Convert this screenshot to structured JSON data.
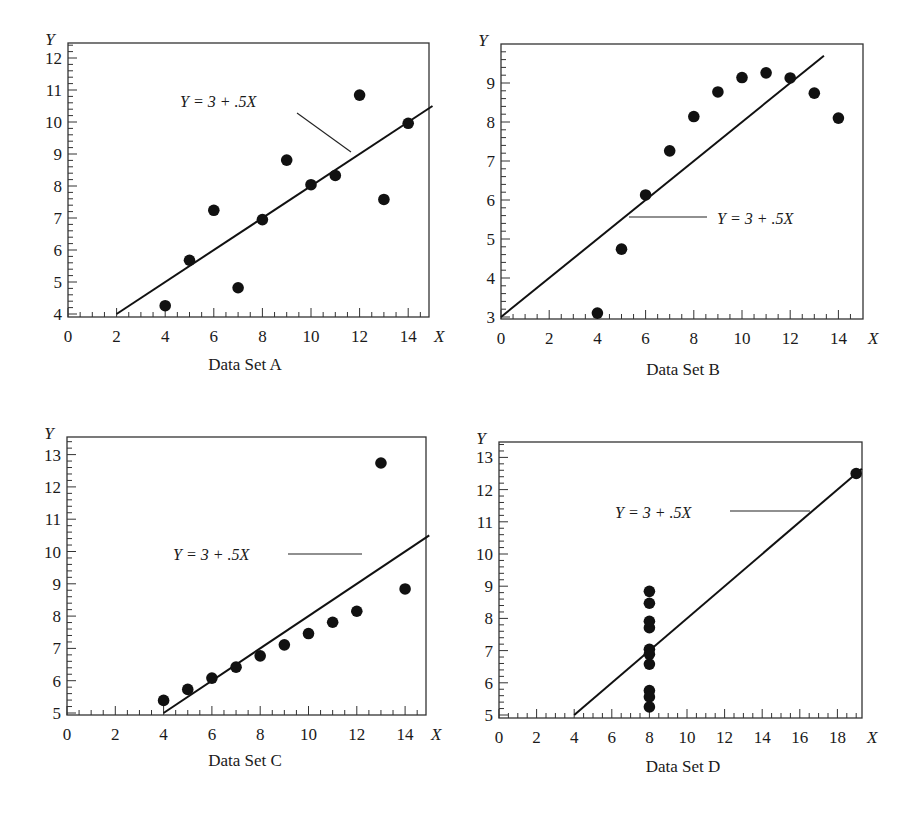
{
  "figure": {
    "equation_label": "Y = 3 + .5X",
    "x_axis_var": "X",
    "y_axis_var": "Y"
  },
  "chart_data": [
    {
      "type": "scatter",
      "title": "Data Set A",
      "xlabel": "X",
      "ylabel": "Y",
      "xlim": [
        0,
        15
      ],
      "ylim": [
        4,
        12.5
      ],
      "x_ticks": [
        0,
        2,
        4,
        6,
        8,
        10,
        12,
        14
      ],
      "y_ticks": [
        4,
        5,
        6,
        7,
        8,
        9,
        10,
        11,
        12
      ],
      "grid": false,
      "fit_line": {
        "intercept": 3,
        "slope": 0.5,
        "label": "Y = 3 + .5X"
      },
      "x": [
        10,
        8,
        13,
        9,
        11,
        14,
        6,
        4,
        12,
        7,
        5
      ],
      "y": [
        8.04,
        6.95,
        7.58,
        8.81,
        8.33,
        9.96,
        7.24,
        4.26,
        10.84,
        4.82,
        5.68
      ]
    },
    {
      "type": "scatter",
      "title": "Data Set B",
      "xlabel": "X",
      "ylabel": "Y",
      "xlim": [
        0,
        15
      ],
      "ylim": [
        3,
        9.7
      ],
      "x_ticks": [
        0,
        2,
        4,
        6,
        8,
        10,
        12,
        14
      ],
      "y_ticks": [
        3,
        4,
        5,
        6,
        7,
        8,
        9
      ],
      "grid": false,
      "fit_line": {
        "intercept": 3,
        "slope": 0.5,
        "label": "Y = 3 + .5X"
      },
      "x": [
        10,
        8,
        13,
        9,
        11,
        14,
        6,
        4,
        12,
        7,
        5
      ],
      "y": [
        9.14,
        8.14,
        8.74,
        8.77,
        9.26,
        8.1,
        6.13,
        3.1,
        9.13,
        7.26,
        4.74
      ]
    },
    {
      "type": "scatter",
      "title": "Data Set C",
      "xlabel": "X",
      "ylabel": "Y",
      "xlim": [
        0,
        15
      ],
      "ylim": [
        5,
        13.5
      ],
      "x_ticks": [
        0,
        2,
        4,
        6,
        8,
        10,
        12,
        14
      ],
      "y_ticks": [
        5,
        6,
        7,
        8,
        9,
        10,
        11,
        12,
        13
      ],
      "grid": false,
      "fit_line": {
        "intercept": 3,
        "slope": 0.5,
        "label": "Y = 3 + .5X"
      },
      "x": [
        10,
        8,
        13,
        9,
        11,
        14,
        6,
        4,
        12,
        7,
        5
      ],
      "y": [
        7.46,
        6.77,
        12.74,
        7.11,
        7.81,
        8.84,
        6.08,
        5.39,
        8.15,
        6.42,
        5.73
      ]
    },
    {
      "type": "scatter",
      "title": "Data Set D",
      "xlabel": "X",
      "ylabel": "Y",
      "xlim": [
        0,
        19.3
      ],
      "ylim": [
        5,
        13.5
      ],
      "x_ticks": [
        0,
        2,
        4,
        6,
        8,
        10,
        12,
        14,
        16,
        18
      ],
      "y_ticks": [
        5,
        6,
        7,
        8,
        9,
        10,
        11,
        12,
        13
      ],
      "grid": false,
      "fit_line": {
        "intercept": 3,
        "slope": 0.5,
        "label": "Y = 3 + .5X"
      },
      "x": [
        8,
        8,
        8,
        8,
        8,
        8,
        8,
        19,
        8,
        8,
        8
      ],
      "y": [
        6.58,
        5.76,
        7.71,
        8.84,
        8.47,
        7.04,
        5.25,
        12.5,
        5.56,
        7.91,
        6.89
      ]
    }
  ],
  "layout": [
    {
      "left": 68,
      "right": 429,
      "top": 43,
      "bottom": 317,
      "x0": 68,
      "xs": 24.3,
      "y0": 314,
      "yv0": 4,
      "ys": 32.0,
      "caption_x": 245,
      "caption_y": 370,
      "eq": {
        "x": 180,
        "y": 107,
        "lx1": 297,
        "ly1": 113,
        "lx2": 351,
        "ly2": 152
      }
    },
    {
      "left": 501,
      "right": 863,
      "top": 44,
      "bottom": 319,
      "x0": 501,
      "xs": 24.1,
      "y0": 317,
      "yv0": 3,
      "ys": 39.0,
      "caption_x": 683,
      "caption_y": 375,
      "eq": {
        "x": 717,
        "y": 224,
        "lx1": 707,
        "ly1": 217,
        "lx2": 629,
        "ly2": 217
      }
    },
    {
      "left": 67,
      "right": 426,
      "top": 437,
      "bottom": 715,
      "x0": 67,
      "xs": 24.15,
      "y0": 713,
      "yv0": 5,
      "ys": 32.3,
      "caption_x": 245,
      "caption_y": 766,
      "eq": {
        "x": 173,
        "y": 560,
        "lx1": 288,
        "ly1": 554,
        "lx2": 362,
        "ly2": 554
      }
    },
    {
      "left": 499,
      "right": 862,
      "top": 442,
      "bottom": 718,
      "x0": 499,
      "xs": 18.8,
      "y0": 715,
      "yv0": 5,
      "ys": 32.2,
      "caption_x": 683,
      "caption_y": 772,
      "eq": {
        "x": 615,
        "y": 518,
        "lx1": 730,
        "ly1": 511,
        "lx2": 810,
        "ly2": 511
      }
    }
  ]
}
